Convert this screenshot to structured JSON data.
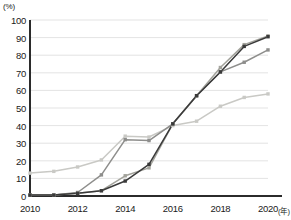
{
  "chart_data": {
    "type": "line",
    "title": "",
    "subtitle": "",
    "xlabel": "(年)",
    "ylabel": "(%)",
    "unit_label": "(%)",
    "x_unit_label": "(年)",
    "x": [
      2010,
      2011,
      2012,
      2013,
      2014,
      2015,
      2016,
      2017,
      2018,
      2019,
      2020
    ],
    "xtick_labels": [
      "2010",
      "2012",
      "2014",
      "2016",
      "2018",
      "2020"
    ],
    "xticks": [
      2010,
      2012,
      2014,
      2016,
      2018,
      2020
    ],
    "ytick_labels": [
      "0",
      "10",
      "20",
      "30",
      "40",
      "50",
      "60",
      "70",
      "80",
      "90",
      "100"
    ],
    "yticks": [
      0,
      10,
      20,
      30,
      40,
      50,
      60,
      70,
      80,
      90,
      100
    ],
    "ylim": [
      0,
      100
    ],
    "xlim": [
      2010,
      2020
    ],
    "grid": true,
    "grid_axis": "y",
    "legend": false,
    "legend_position": "none",
    "marker": "square",
    "series": [
      {
        "name": "series-1-light-gray",
        "color": "#c9c9c5",
        "values": [
          13,
          14,
          16.5,
          20.5,
          34,
          33.5,
          40,
          42.5,
          51,
          56,
          58
        ]
      },
      {
        "name": "series-2-medium-gray",
        "color": "#8e8e8c",
        "values": [
          0.5,
          0.5,
          2,
          12,
          32,
          31.5,
          41,
          57,
          70.5,
          76,
          83
        ]
      },
      {
        "name": "series-3-gray",
        "color": "#a3a39c",
        "values": [
          0.5,
          0.5,
          1.5,
          3,
          11.5,
          16,
          41,
          57,
          73,
          86,
          91
        ]
      },
      {
        "name": "series-4-dark",
        "color": "#3a3a3a",
        "values": [
          0.5,
          0.5,
          1.5,
          3,
          8.5,
          18,
          41,
          57,
          70.5,
          85,
          90.5
        ]
      }
    ],
    "axis_color": "#2b2b2b",
    "grid_color": "#dcdcdc",
    "background": "#ffffff"
  }
}
